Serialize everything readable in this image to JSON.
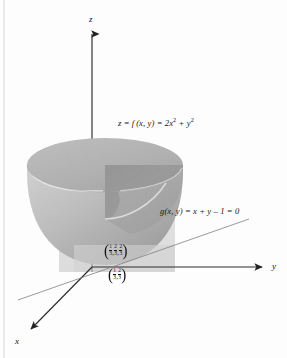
{
  "figure": {
    "kind": "3d-surface-diagram",
    "background_color": "#fdfdfd",
    "ink_color": "#141414"
  },
  "axes": {
    "z": {
      "label": "z",
      "direction": "up"
    },
    "y": {
      "label": "y",
      "direction": "right"
    },
    "x": {
      "label": "x",
      "direction": "down-left"
    }
  },
  "labels": {
    "surface_equation": {
      "lhs": "z = f (x, y) = 2x",
      "exp1": "2",
      "mid": " + y",
      "exp2": "2"
    },
    "constraint_equation": "g(x, y) = x + y – 1 = 0"
  },
  "points": {
    "tangency_3d": {
      "open": "(",
      "coords": [
        {
          "num": "1",
          "den": "3"
        },
        {
          "num": "2",
          "den": "3"
        },
        {
          "num": "2",
          "den": "3"
        }
      ],
      "close": ")",
      "separator": ","
    },
    "tangency_2d": {
      "open": "(",
      "coords": [
        {
          "num": "1",
          "den": "3"
        },
        {
          "num": "2",
          "den": "3"
        }
      ],
      "close": ")",
      "separator": ","
    }
  },
  "colors": {
    "surface_outer_light": "#c2c2c2",
    "surface_outer_dark": "#9b9b9b",
    "surface_interior": "#8e8e8e",
    "rim_top": "#b6b6b6",
    "plane_fill": "#d7d7d7",
    "axis_line": "#2b2b2b",
    "constraint_line": "#7d7d7d"
  }
}
